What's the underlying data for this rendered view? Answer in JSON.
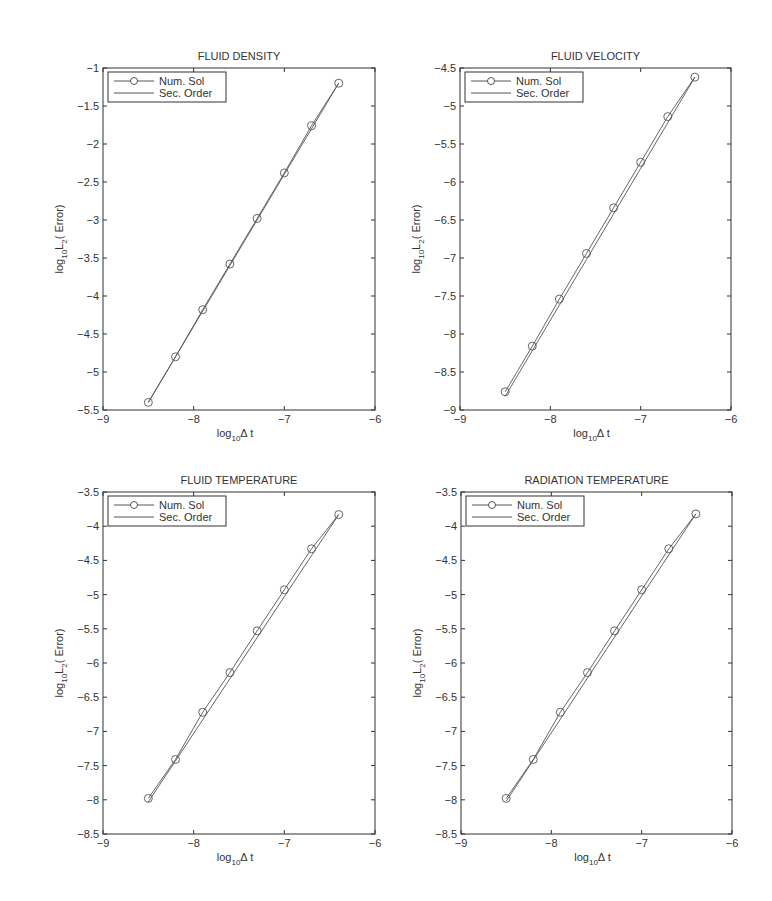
{
  "figure": {
    "legend": {
      "num_label": "Num. Sol",
      "ref_label": "Sec. Order"
    },
    "xlabel_main": "log",
    "xlabel_sub": "10",
    "xlabel_tail": "Δ t",
    "ylabel_main": "log",
    "ylabel_sub1": "10",
    "ylabel_mid": "L",
    "ylabel_sub2": "2",
    "ylabel_tail": "( Error)"
  },
  "chart_data": [
    {
      "type": "line",
      "title": "FLUID DENSITY",
      "xlabel": "log10 Δt",
      "ylabel": "log10 L2( Error)",
      "xlim": [
        -9,
        -6
      ],
      "ylim": [
        -5.5,
        -1
      ],
      "xticks": [
        "-9",
        "-8",
        "-7",
        "-6"
      ],
      "yticks": [
        "-5.5",
        "-5",
        "-4.5",
        "-4",
        "-3.5",
        "-3",
        "-2.5",
        "-2",
        "-1.5",
        "-1"
      ],
      "legend_position": "upper left",
      "grid": false,
      "x": [
        -8.5,
        -8.2,
        -7.9,
        -7.6,
        -7.3,
        -7.0,
        -6.7,
        -6.4
      ],
      "series": [
        {
          "name": "Num. Sol",
          "marker": "circle",
          "values": [
            -5.4,
            -4.8,
            -4.18,
            -3.58,
            -2.98,
            -2.38,
            -1.76,
            -1.2
          ]
        },
        {
          "name": "Sec. Order",
          "marker": "none",
          "values": [
            -5.4,
            -4.8,
            -4.2,
            -3.6,
            -3.0,
            -2.4,
            -1.8,
            -1.2
          ]
        }
      ]
    },
    {
      "type": "line",
      "title": "FLUID VELOCITY",
      "xlabel": "log10 Δt",
      "ylabel": "log10 L2( Error)",
      "xlim": [
        -9,
        -6
      ],
      "ylim": [
        -9,
        -4.5
      ],
      "xticks": [
        "-9",
        "-8",
        "-7",
        "-6"
      ],
      "yticks": [
        "-9",
        "-8.5",
        "-8",
        "-7.5",
        "-7",
        "-6.5",
        "-6",
        "-5.5",
        "-5",
        "-4.5"
      ],
      "legend_position": "upper left",
      "grid": false,
      "x": [
        -8.5,
        -8.2,
        -7.9,
        -7.6,
        -7.3,
        -7.0,
        -6.7,
        -6.4
      ],
      "series": [
        {
          "name": "Num. Sol",
          "marker": "circle",
          "values": [
            -8.76,
            -8.16,
            -7.54,
            -6.94,
            -6.34,
            -5.74,
            -5.14,
            -4.62
          ]
        },
        {
          "name": "Sec. Order",
          "marker": "none",
          "values": [
            -8.82,
            -8.22,
            -7.62,
            -7.02,
            -6.42,
            -5.82,
            -5.22,
            -4.62
          ]
        }
      ]
    },
    {
      "type": "line",
      "title": "FLUID TEMPERATURE",
      "xlabel": "log10 Δt",
      "ylabel": "log10 L2( Error)",
      "xlim": [
        -9,
        -6
      ],
      "ylim": [
        -8.5,
        -3.5
      ],
      "xticks": [
        "-9",
        "-8",
        "-7",
        "-6"
      ],
      "yticks": [
        "-8.5",
        "-8",
        "-7.5",
        "-7",
        "-6.5",
        "-6",
        "-5.5",
        "-5",
        "-4.5",
        "-4",
        "-3.5"
      ],
      "legend_position": "upper left",
      "grid": false,
      "x": [
        -8.5,
        -8.2,
        -7.9,
        -7.6,
        -7.3,
        -7.0,
        -6.7,
        -6.4
      ],
      "series": [
        {
          "name": "Num. Sol",
          "marker": "circle",
          "values": [
            -7.98,
            -7.41,
            -6.72,
            -6.14,
            -5.53,
            -4.93,
            -4.33,
            -3.83
          ]
        },
        {
          "name": "Sec. Order",
          "marker": "none",
          "values": [
            -8.03,
            -7.43,
            -6.83,
            -6.23,
            -5.63,
            -5.03,
            -4.43,
            -3.83
          ]
        }
      ]
    },
    {
      "type": "line",
      "title": "RADIATION TEMPERATURE",
      "xlabel": "log10 Δt",
      "ylabel": "log10 L2( Error)",
      "xlim": [
        -9,
        -6
      ],
      "ylim": [
        -8.5,
        -3.5
      ],
      "xticks": [
        "-9",
        "-8",
        "-7",
        "-6"
      ],
      "yticks": [
        "-8.5",
        "-8",
        "-7.5",
        "-7",
        "-6.5",
        "-6",
        "-5.5",
        "-5",
        "-4.5",
        "-4",
        "-3.5"
      ],
      "legend_position": "upper left",
      "grid": false,
      "x": [
        -8.5,
        -8.2,
        -7.9,
        -7.6,
        -7.3,
        -7.0,
        -6.7,
        -6.4
      ],
      "series": [
        {
          "name": "Num. Sol",
          "marker": "circle",
          "values": [
            -7.98,
            -7.41,
            -6.72,
            -6.14,
            -5.53,
            -4.93,
            -4.33,
            -3.82
          ]
        },
        {
          "name": "Sec. Order",
          "marker": "none",
          "values": [
            -8.02,
            -7.42,
            -6.82,
            -6.22,
            -5.62,
            -5.02,
            -4.42,
            -3.82
          ]
        }
      ]
    }
  ],
  "layout": {
    "panels": [
      {
        "left": 103,
        "top": 68,
        "width": 272,
        "height": 342
      },
      {
        "left": 460,
        "top": 68,
        "width": 271,
        "height": 342
      },
      {
        "left": 103,
        "top": 492,
        "width": 272,
        "height": 342
      },
      {
        "left": 461,
        "top": 492,
        "width": 271,
        "height": 342
      }
    ],
    "colors": {
      "axis": "#333333",
      "line": "#555555",
      "text": "#333333"
    }
  }
}
